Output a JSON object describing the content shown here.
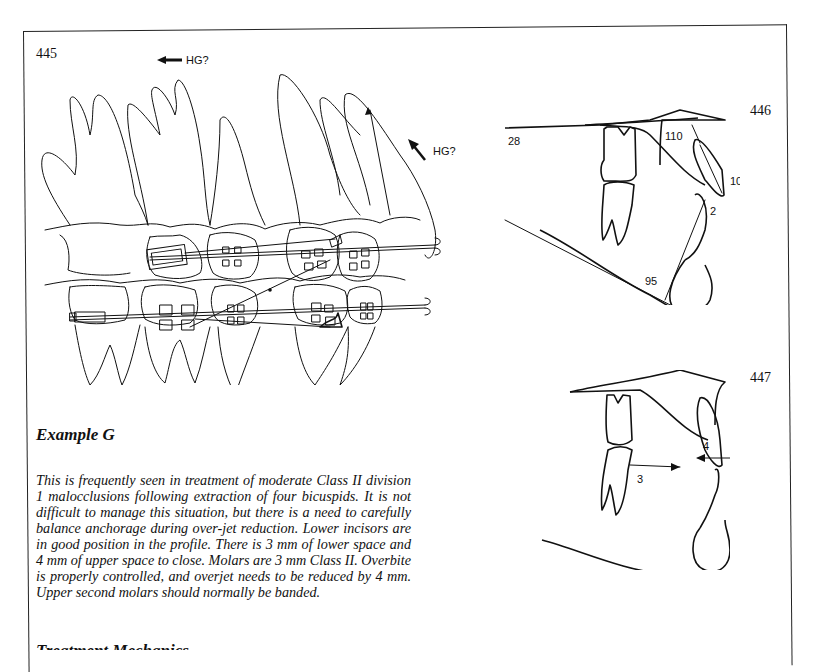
{
  "figures": {
    "fig445": {
      "number": "445",
      "annotations": [
        {
          "id": "hg-left",
          "text": "HG?",
          "arrow": "left"
        },
        {
          "id": "hg-right",
          "text": "HG?",
          "arrow": "up-left"
        }
      ]
    },
    "fig446": {
      "number": "446",
      "labels": {
        "sn_angle": "28",
        "upper_incisor_angle": "110",
        "upper_incisor_mm": "10",
        "lower_incisor_mm": "2",
        "impa": "95"
      }
    },
    "fig447": {
      "number": "447",
      "labels": {
        "lower_space": "3",
        "upper_space": "4"
      }
    }
  },
  "section": {
    "heading": "Example G",
    "paragraph": "This is frequently seen in treatment of moderate Class II division 1 malocclusions following extraction of four bicuspids. It is not difficult to manage this situation, but there is a need to carefully balance anchorage during over-jet reduction. Lower incisors are in good position in the profile. There is 3 mm of lower space and 4 mm of upper space to close. Molars are 3 mm Class II. Overbite is properly controlled, and overjet needs to be reduced by 4 mm. Upper second molars should normally be banded.",
    "next_heading_partial": "Treatment Mechanics"
  }
}
